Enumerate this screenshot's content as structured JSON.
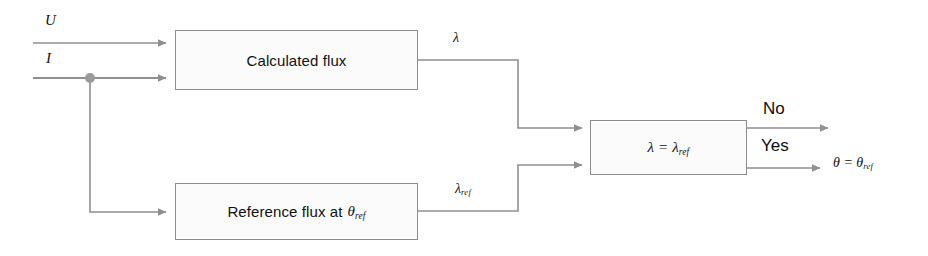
{
  "diagram": {
    "inputs": [
      {
        "name": "voltage-input",
        "label": "U"
      },
      {
        "name": "current-input",
        "label": "I"
      }
    ],
    "blocks": {
      "calculated_flux": {
        "label": "Calculated flux"
      },
      "reference_flux": {
        "label_text": "Reference flux at",
        "symbol": "θ",
        "symbol_sub": "ref"
      },
      "comparator": {
        "lhs": "λ",
        "operator": "=",
        "rhs": "λ",
        "rhs_sub": "ref"
      }
    },
    "signals": {
      "lambda": {
        "label": "λ"
      },
      "lambda_ref": {
        "label": "λ",
        "sub": "ref"
      }
    },
    "branches": {
      "no": "No",
      "yes": "Yes"
    },
    "outputs": {
      "theta_result": {
        "lhs": "θ",
        "operator": "=",
        "rhs": "θ",
        "rhs_sub": "ref"
      }
    },
    "colors": {
      "wire": "#8f8f8f",
      "block_border": "#8d8d8d",
      "block_fill": "#fbfbfb",
      "text": "#111111",
      "background": "#ffffff"
    }
  }
}
